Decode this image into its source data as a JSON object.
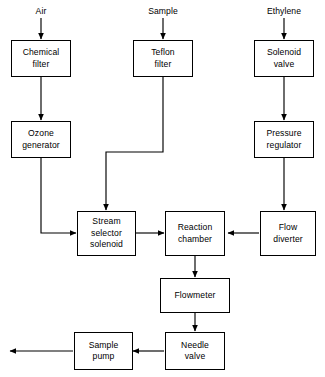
{
  "diagram": {
    "stroke_color": "#000000",
    "background_color": "#ffffff",
    "inputs": [
      {
        "id": "air",
        "label": "Air"
      },
      {
        "id": "sample",
        "label": "Sample"
      },
      {
        "id": "ethylene",
        "label": "Ethylene"
      }
    ],
    "nodes": [
      {
        "id": "chemical-filter",
        "label": "Chemical\nfilter"
      },
      {
        "id": "teflon-filter",
        "label": "Teflon\nfilter"
      },
      {
        "id": "solenoid-valve",
        "label": "Solenoid\nvalve"
      },
      {
        "id": "ozone-generator",
        "label": "Ozone\ngenerator"
      },
      {
        "id": "pressure-regulator",
        "label": "Pressure\nregulator"
      },
      {
        "id": "stream-selector-solenoid",
        "label": "Stream\nselector\nsolenoid"
      },
      {
        "id": "reaction-chamber",
        "label": "Reaction\nchamber"
      },
      {
        "id": "flow-diverter",
        "label": "Flow\ndiverter"
      },
      {
        "id": "flowmeter",
        "label": "Flowmeter"
      },
      {
        "id": "needle-valve",
        "label": "Needle\nvalve"
      },
      {
        "id": "sample-pump",
        "label": "Sample\npump"
      }
    ],
    "edges": [
      {
        "from": "air",
        "to": "chemical-filter"
      },
      {
        "from": "chemical-filter",
        "to": "ozone-generator"
      },
      {
        "from": "ozone-generator",
        "to": "stream-selector-solenoid"
      },
      {
        "from": "sample",
        "to": "teflon-filter"
      },
      {
        "from": "teflon-filter",
        "to": "stream-selector-solenoid"
      },
      {
        "from": "ethylene",
        "to": "solenoid-valve"
      },
      {
        "from": "solenoid-valve",
        "to": "pressure-regulator"
      },
      {
        "from": "pressure-regulator",
        "to": "flow-diverter"
      },
      {
        "from": "flow-diverter",
        "to": "reaction-chamber"
      },
      {
        "from": "stream-selector-solenoid",
        "to": "reaction-chamber"
      },
      {
        "from": "reaction-chamber",
        "to": "flowmeter"
      },
      {
        "from": "flowmeter",
        "to": "needle-valve"
      },
      {
        "from": "needle-valve",
        "to": "sample-pump"
      },
      {
        "from": "sample-pump",
        "to": "exhaust-outlet"
      }
    ]
  }
}
